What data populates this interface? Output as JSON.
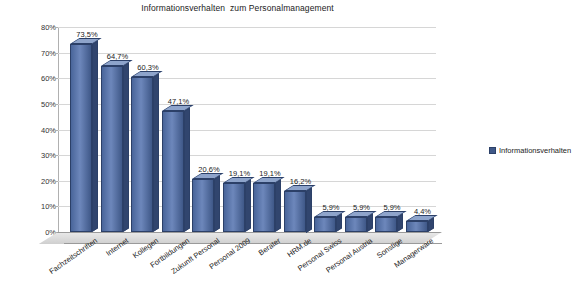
{
  "chart_data": {
    "type": "bar",
    "title": "Informationsverhalten  zum Personalmanagement",
    "xlabel": "",
    "ylabel": "",
    "ylim": [
      0,
      80
    ],
    "ytick_step": 10,
    "ytick_labels": [
      "0%",
      "10%",
      "20%",
      "30%",
      "40%",
      "50%",
      "60%",
      "70%",
      "80%"
    ],
    "grid": true,
    "legend_position": "right",
    "legend": [
      "Informationsverhalten"
    ],
    "categories": [
      "Fachzeitschriften",
      "Internet",
      "Kollegen",
      "Fortbildungen",
      "Zukunft Personal",
      "Personal 2009",
      "Berater",
      "HRM.de",
      "Personal Swiss",
      "Personal Austria",
      "Sonstige",
      "Managerware"
    ],
    "values": [
      73.5,
      64.7,
      60.3,
      47.1,
      20.6,
      19.1,
      19.1,
      16.2,
      5.9,
      5.9,
      5.9,
      4.4
    ],
    "value_labels": [
      "73,5%",
      "64,7%",
      "60,3%",
      "47,1%",
      "20,6%",
      "19,1%",
      "19,1%",
      "16,2%",
      "5,9%",
      "5,9%",
      "5,9%",
      "4,4%"
    ],
    "series_color": "#3f5888"
  }
}
